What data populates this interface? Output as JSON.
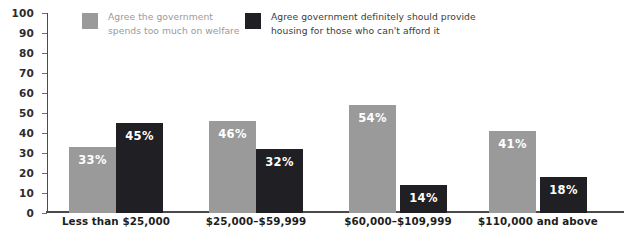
{
  "chart_data": {
    "type": "bar",
    "title": "",
    "xlabel": "",
    "ylabel": "",
    "ylim": [
      0,
      100
    ],
    "ytick_step": 10,
    "yticks": [
      100,
      90,
      80,
      70,
      60,
      50,
      40,
      30,
      20,
      10,
      0
    ],
    "grid": false,
    "legend_position": "top",
    "categories": [
      "Less than $25,000",
      "$25,000–$59,999",
      "$60,000–$109,999",
      "$110,000 and above"
    ],
    "series": [
      {
        "name": "Agree the government\nspends too much on welfare",
        "color": "#9a9a9a",
        "values": [
          33,
          46,
          54,
          41
        ],
        "labels": [
          "33%",
          "46%",
          "54%",
          "41%"
        ]
      },
      {
        "name": "Agree government definitely should provide\nhousing for those who can't afford it",
        "color": "#201f24",
        "values": [
          45,
          32,
          14,
          18
        ],
        "labels": [
          "45%",
          "32%",
          "14%",
          "18%"
        ]
      }
    ]
  },
  "legend": {
    "entries": [
      {
        "label": "Agree the government\nspends too much on welfare",
        "swatch_color": "#9a9a9a",
        "text_color": "#9a9a9a"
      },
      {
        "label": "Agree government definitely should provide\nhousing for those who can't afford it",
        "swatch_color": "#201f24",
        "text_color": "#3c3c3c"
      }
    ]
  },
  "axis": {
    "y_tick_labels": [
      "100",
      "90",
      "80",
      "70",
      "60",
      "50",
      "40",
      "30",
      "20",
      "10",
      "0"
    ],
    "axis_color": "#4a4a4a"
  },
  "colors": {
    "background": "#ffffff",
    "series_light": "#9a9a9a",
    "series_dark": "#201f24",
    "value_label": "#ffffff",
    "category_label": "#1d1d1d"
  }
}
